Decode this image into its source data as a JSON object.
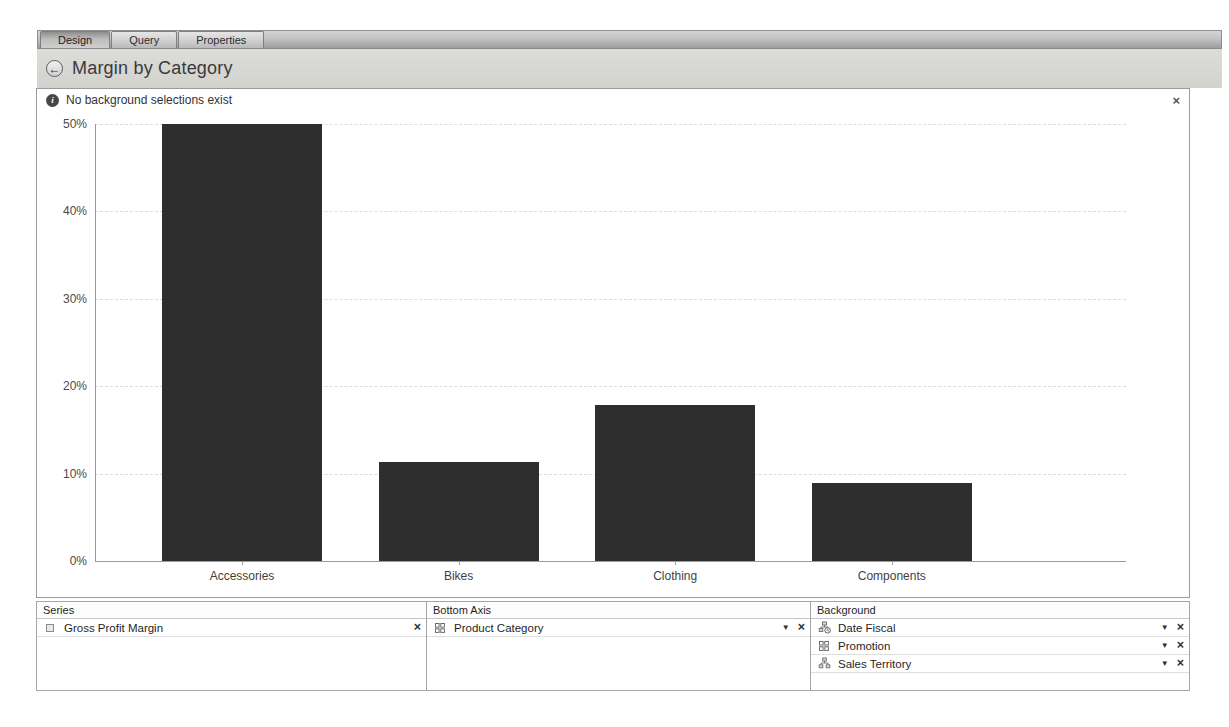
{
  "tabs": [
    {
      "label": "Design",
      "active": true
    },
    {
      "label": "Query",
      "active": false
    },
    {
      "label": "Properties",
      "active": false
    }
  ],
  "header": {
    "title": "Margin by Category",
    "back_icon": "←"
  },
  "notification": {
    "text": "No background selections exist",
    "info_icon": "i",
    "close_icon": "×"
  },
  "chart_data": {
    "type": "bar",
    "title": "Margin by Category",
    "categories": [
      "Accessories",
      "Bikes",
      "Clothing",
      "Components"
    ],
    "values": [
      50,
      11.3,
      17.8,
      8.9
    ],
    "series_name": "Gross Profit Margin",
    "xlabel": "",
    "ylabel": "",
    "ylim": [
      0,
      50
    ],
    "yticks": [
      "0%",
      "10%",
      "20%",
      "30%",
      "40%",
      "50%"
    ],
    "grid": true,
    "legend": false,
    "bar_color": "#2e2e2e"
  },
  "panels": {
    "series": {
      "title": "Series",
      "items": [
        {
          "label": "Gross Profit Margin",
          "icon": "measure-icon"
        }
      ]
    },
    "bottom_axis": {
      "title": "Bottom Axis",
      "items": [
        {
          "label": "Product Category",
          "icon": "dimension-icon"
        }
      ]
    },
    "background": {
      "title": "Background",
      "items": [
        {
          "label": "Date Fiscal",
          "icon": "date-hierarchy-icon"
        },
        {
          "label": "Promotion",
          "icon": "dimension-icon"
        },
        {
          "label": "Sales Territory",
          "icon": "hierarchy-icon"
        }
      ]
    }
  },
  "icons": {
    "dropdown": "▼",
    "close": "×"
  }
}
